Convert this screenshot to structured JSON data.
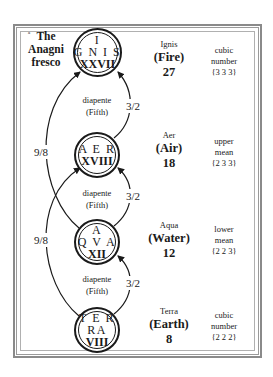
{
  "title": "The Anagni fresco",
  "title_lines": [
    "The",
    "Anagni",
    "fresco"
  ],
  "elements": [
    {
      "circle_lines": [
        "I",
        "G N I S"
      ],
      "circle_numeral": "XXVII",
      "latin": "Ignis",
      "english": "(Fire)",
      "value": "27",
      "desc_lines": [
        "cubic",
        "number",
        "{3 3 3}"
      ]
    },
    {
      "circle_lines": [
        "A E R"
      ],
      "circle_numeral": "XVIII",
      "latin": "Aer",
      "english": "(Air)",
      "value": "18",
      "desc_lines": [
        "upper",
        "mean",
        "{2 3 3}"
      ]
    },
    {
      "circle_lines": [
        "A",
        "Q V A"
      ],
      "circle_numeral": "XII",
      "latin": "Aqua",
      "english": "(Water)",
      "value": "12",
      "desc_lines": [
        "lower",
        "mean",
        "{2 2 3}"
      ]
    },
    {
      "circle_lines": [
        "T E R",
        "RA"
      ],
      "circle_numeral": "VIII",
      "latin": "Terra",
      "english": "(Earth)",
      "value": "8",
      "desc_lines": [
        "cubic",
        "number",
        "{2 2 2}"
      ]
    }
  ],
  "intervals": [
    {
      "name": "diapente",
      "translation": "(Fifth)",
      "ratio": "3/2"
    },
    {
      "name": "diapente",
      "translation": "(Fifth)",
      "ratio": "3/2"
    },
    {
      "name": "diapente",
      "translation": "(Fifth)",
      "ratio": "3/2"
    }
  ],
  "tones": [
    {
      "ratio": "9/8"
    },
    {
      "ratio": "9/8"
    }
  ],
  "colors": {
    "ink": "#1a1a1a",
    "frame": "#8a8a8a",
    "background": "#ffffff"
  }
}
